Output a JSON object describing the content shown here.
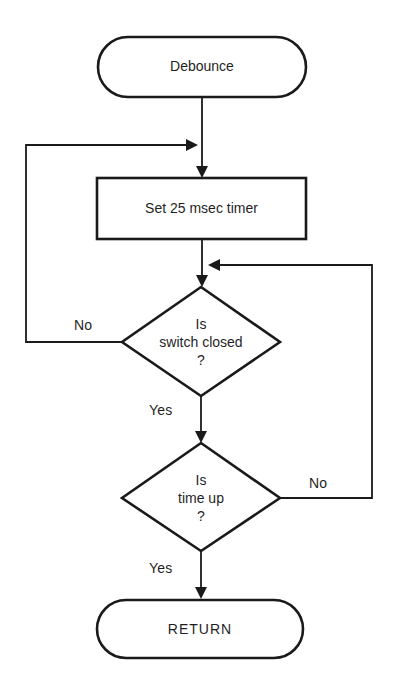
{
  "diagram": {
    "type": "flowchart",
    "nodes": {
      "start": {
        "kind": "terminal",
        "label": "Debounce"
      },
      "set_timer": {
        "kind": "process",
        "label": "Set 25 msec timer"
      },
      "switch_closed": {
        "kind": "decision",
        "line1": "Is",
        "line2": "switch closed",
        "line3": "?"
      },
      "time_up": {
        "kind": "decision",
        "line1": "Is",
        "line2": "time up",
        "line3": "?"
      },
      "end": {
        "kind": "terminal",
        "label": "RETURN"
      }
    },
    "edges": [
      {
        "from": "start",
        "to": "set_timer",
        "label": ""
      },
      {
        "from": "set_timer",
        "to": "switch_closed",
        "label": ""
      },
      {
        "from": "switch_closed",
        "to": "set_timer",
        "label": "No"
      },
      {
        "from": "switch_closed",
        "to": "time_up",
        "label": "Yes"
      },
      {
        "from": "time_up",
        "to": "switch_closed",
        "label": "No"
      },
      {
        "from": "time_up",
        "to": "end",
        "label": "Yes"
      }
    ],
    "edge_labels": {
      "switch_no": "No",
      "switch_yes": "Yes",
      "time_no": "No",
      "time_yes": "Yes"
    },
    "colors": {
      "ink": "#1a1a1a",
      "background": "#ffffff"
    }
  }
}
